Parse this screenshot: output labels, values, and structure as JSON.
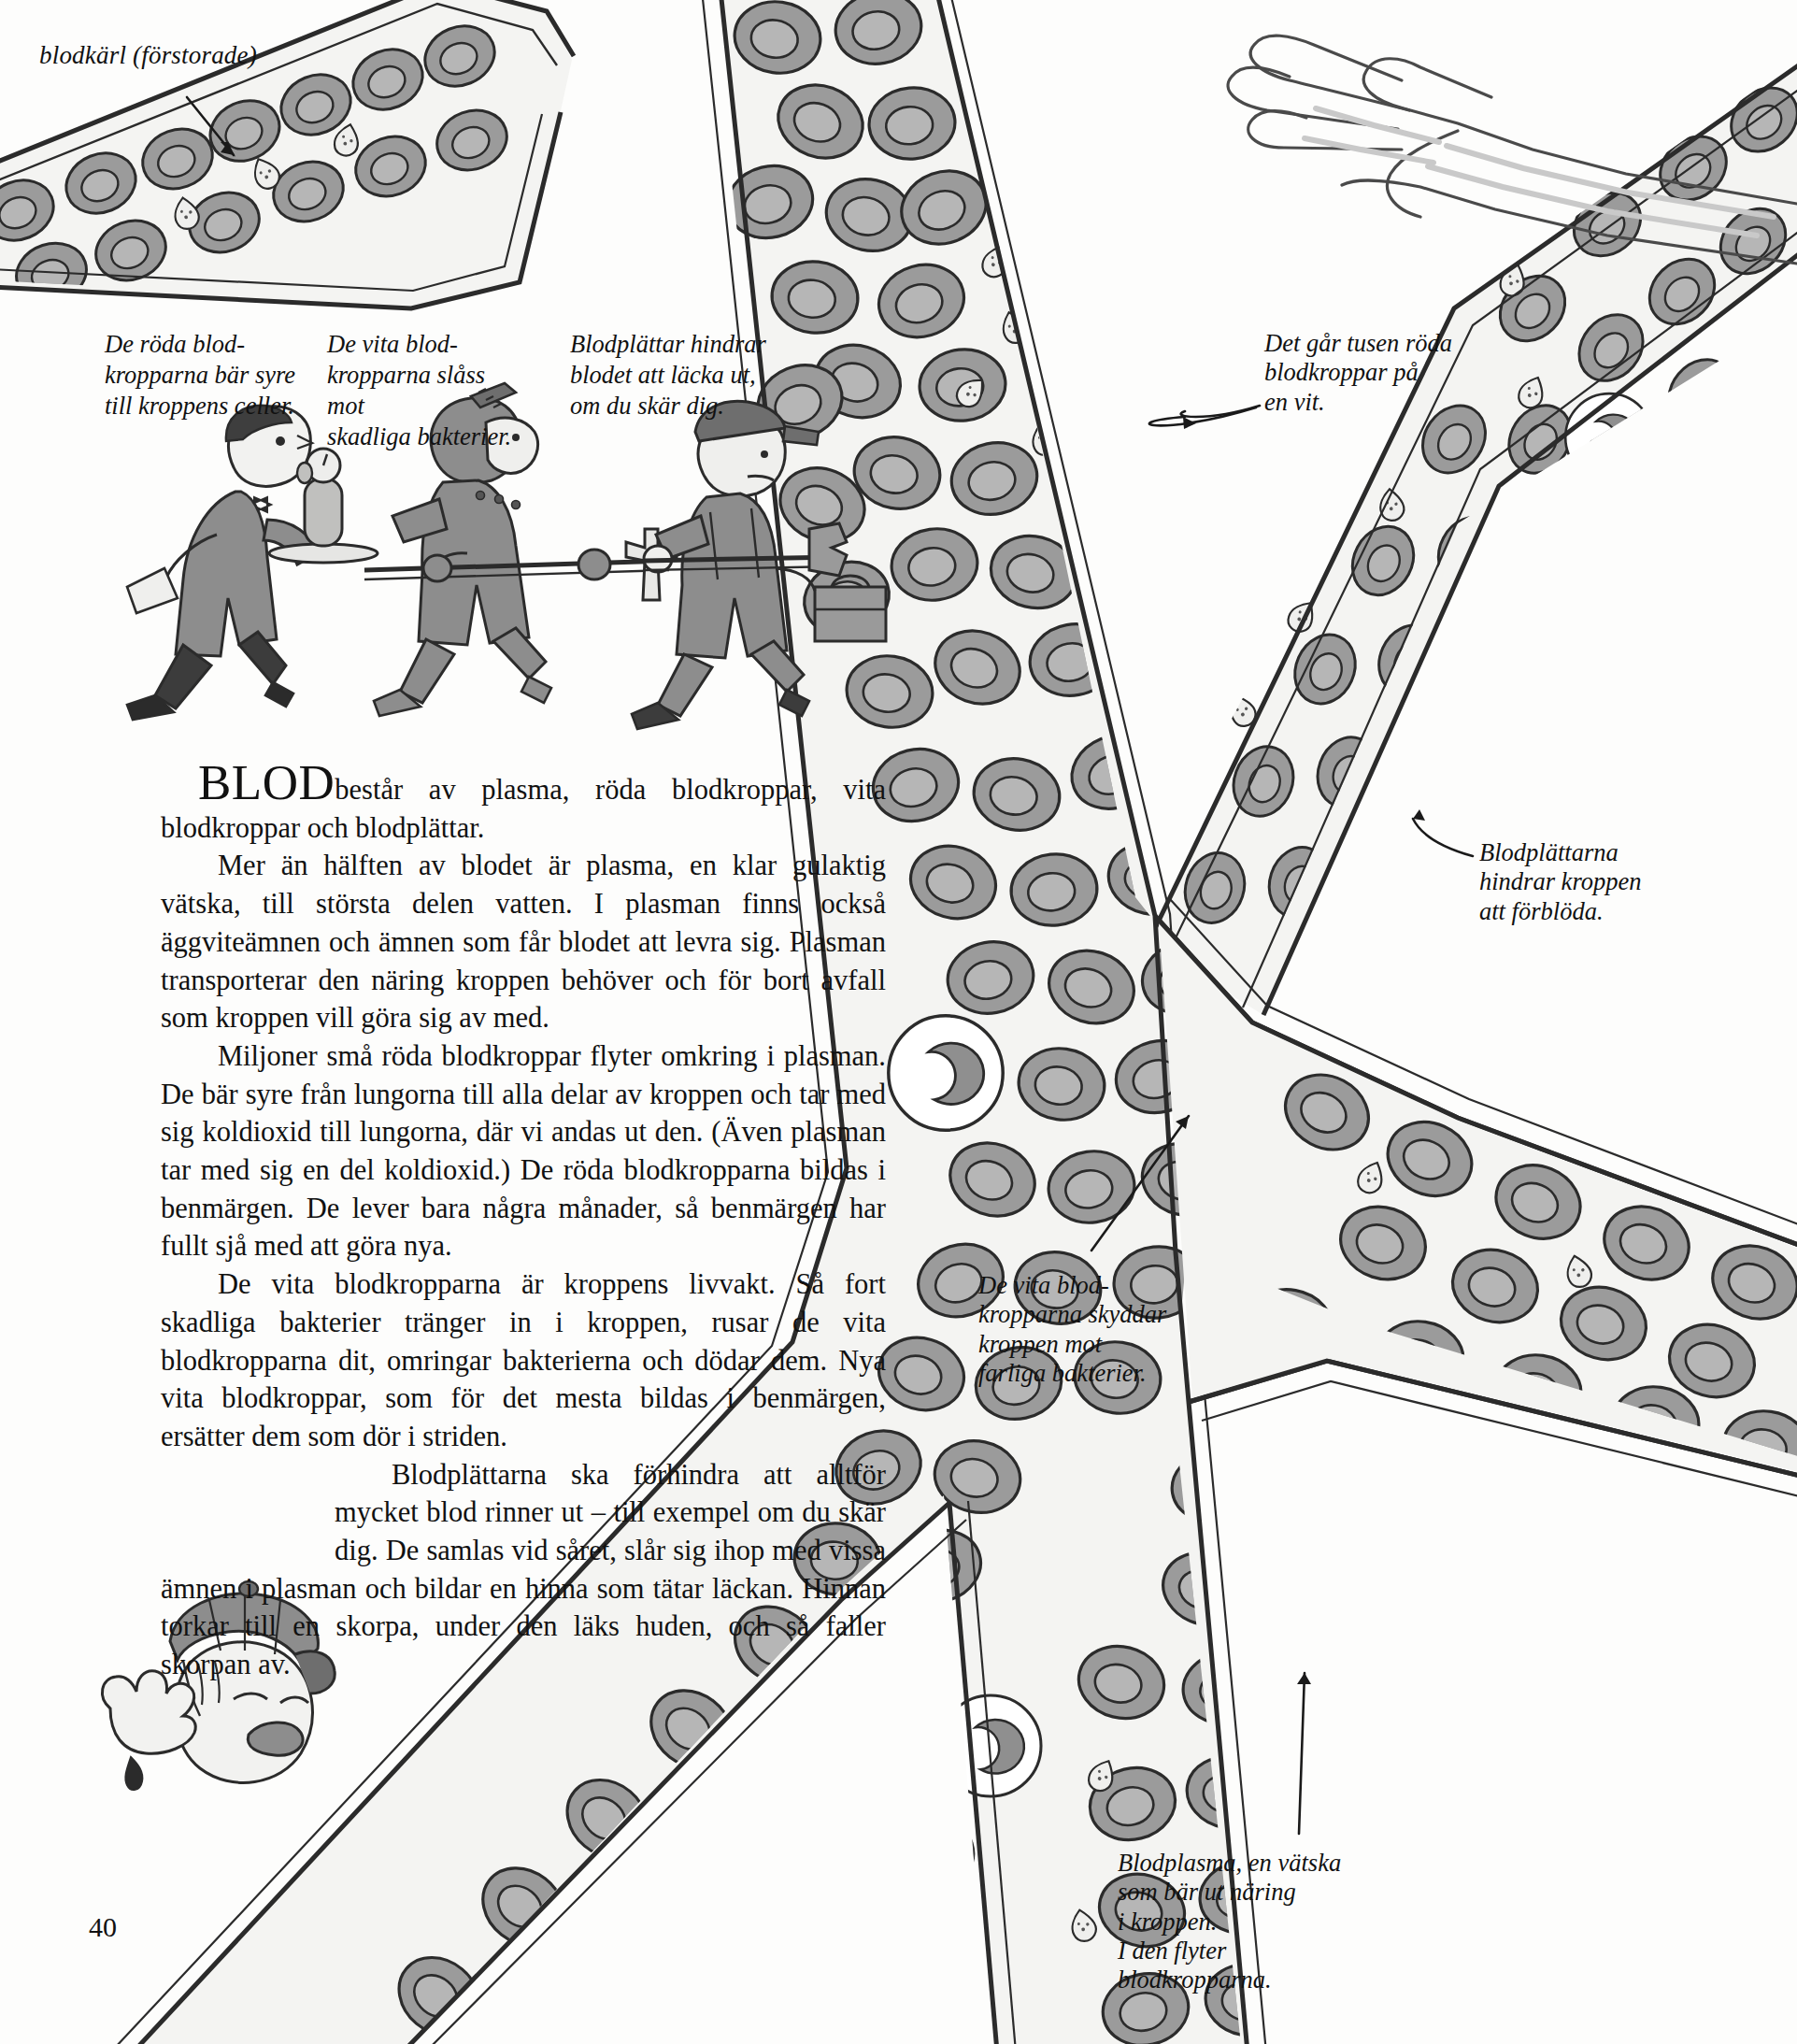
{
  "page": {
    "number": "40",
    "language": "sv"
  },
  "labels": {
    "vessel": "blodkärl (förstorade)",
    "thousand_red": "Det går tusen röda\nblodkroppar på\nen vit.",
    "platelets": "Blodplättarna\nhindrar kroppen\natt förblöda.",
    "white_cells": "De vita blod-\nkropparna skyddar\nkroppen mot\nfarliga bakterier.",
    "plasma": "Blodplasma, en vätska\nsom bär ut näring\ni kroppen.\nI den flyter\nblodkropparna."
  },
  "figure_captions": {
    "red": "De röda blod-\nkropparna bär syre\ntill kroppens celler.",
    "white": "De vita blod-\nkropparna slåss mot\nskadliga bakterier.",
    "platelet": "Blodplättar hindrar\nblodet att läcka ut,\nom du skär dig."
  },
  "body": {
    "lead_word": "BLOD",
    "p1_rest": "består av plasma, röda blodkroppar, vita blodkroppar och blodplättar.",
    "p2": "Mer än hälften av blodet är plasma, en klar gulaktig vätska, till största delen vatten. I plasman finns också äggviteämnen och ämnen som får blodet att levra sig. Plasman transporterar den näring kroppen behöver och för bort avfall som kroppen vill göra sig av med.",
    "p3": "Miljoner små röda blodkroppar flyter omkring i plasman. De bär syre från lungorna till alla delar av kroppen och tar med sig koldioxid till lungorna, där vi andas ut den. (Även plasman tar med sig en del koldioxid.) De röda blodkropparna bildas i benmärgen. De lever bara några månader, så benmärgen har fullt sjå med att göra nya.",
    "p4": "De vita blodkropparna är kroppens livvakt. Så fort skadliga bakterier tränger in i kroppen, rusar de vita blodkropparna dit, omringar bakterierna och dödar dem. Nya vita blodkroppar, som för det mesta bildas i benmärgen, ersätter dem som dör i striden.",
    "p5": "Blodplättarna ska förhindra att alltför mycket blod rinner ut – till exempel om du skär dig. De samlas vid såret, slår sig ihop med vissa ämnen i plasman och bildar en hinna som tätar läckan. Hinnan torkar till en skorpa, under den läks huden, och så faller skorpan av."
  },
  "illustrations": {
    "waiter": "waiter-carrying-oxygen-tank",
    "knight": "knight-with-halberd",
    "workman": "workman-with-toolbox",
    "boy": "crying-boy-with-cut-finger",
    "arm": "outstretched-arm-and-hand",
    "vessel_network": "branching-blood-vessels-with-cells"
  },
  "colors": {
    "ink": "#1a1a1a",
    "cell_fill": "#9b9b9b",
    "cell_core": "#b4b4b4",
    "plasma_fill": "#f4f4f2",
    "vessel_outline": "#2b2b2b",
    "paper": "#fdfdfc"
  }
}
